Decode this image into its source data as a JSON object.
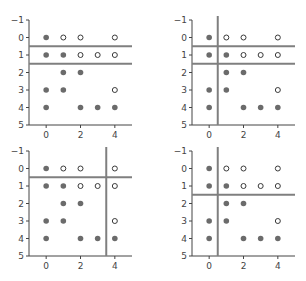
{
  "chart_data": [
    {
      "type": "scatter",
      "title": "",
      "xlabel": "",
      "ylabel": "",
      "xlim": [
        -1,
        5
      ],
      "ylim": [
        5,
        -1
      ],
      "xticks": [
        0,
        2,
        4
      ],
      "yticks": [
        -1,
        0,
        1,
        2,
        3,
        4,
        5
      ],
      "grid": false,
      "series": [
        {
          "name": "filled",
          "marker": "filled-circle",
          "points": [
            [
              0,
              0
            ],
            [
              0,
              1
            ],
            [
              1,
              1
            ],
            [
              1,
              2
            ],
            [
              2,
              2
            ],
            [
              0,
              3
            ],
            [
              1,
              3
            ],
            [
              0,
              4
            ],
            [
              2,
              4
            ],
            [
              3,
              4
            ],
            [
              4,
              4
            ]
          ]
        },
        {
          "name": "open",
          "marker": "open-circle",
          "points": [
            [
              1,
              0
            ],
            [
              2,
              0
            ],
            [
              4,
              0
            ],
            [
              2,
              1
            ],
            [
              3,
              1
            ],
            [
              4,
              1
            ],
            [
              4,
              3
            ]
          ]
        }
      ],
      "hlines": [
        0.5,
        1.5
      ],
      "vlines": []
    },
    {
      "type": "scatter",
      "title": "",
      "xlabel": "",
      "ylabel": "",
      "xlim": [
        -1,
        5
      ],
      "ylim": [
        5,
        -1
      ],
      "xticks": [
        0,
        2,
        4
      ],
      "yticks": [
        -1,
        0,
        1,
        2,
        3,
        4,
        5
      ],
      "grid": false,
      "series": [
        {
          "name": "filled",
          "marker": "filled-circle",
          "points": [
            [
              0,
              0
            ],
            [
              0,
              1
            ],
            [
              1,
              1
            ],
            [
              1,
              2
            ],
            [
              2,
              2
            ],
            [
              0,
              3
            ],
            [
              1,
              3
            ],
            [
              0,
              4
            ],
            [
              2,
              4
            ],
            [
              3,
              4
            ],
            [
              4,
              4
            ]
          ]
        },
        {
          "name": "open",
          "marker": "open-circle",
          "points": [
            [
              1,
              0
            ],
            [
              2,
              0
            ],
            [
              4,
              0
            ],
            [
              2,
              1
            ],
            [
              3,
              1
            ],
            [
              4,
              1
            ],
            [
              4,
              3
            ]
          ]
        }
      ],
      "hlines": [
        0.5,
        1.5
      ],
      "vlines": [
        0.5
      ]
    },
    {
      "type": "scatter",
      "title": "",
      "xlabel": "",
      "ylabel": "",
      "xlim": [
        -1,
        5
      ],
      "ylim": [
        5,
        -1
      ],
      "xticks": [
        0,
        2,
        4
      ],
      "yticks": [
        -1,
        0,
        1,
        2,
        3,
        4,
        5
      ],
      "grid": false,
      "series": [
        {
          "name": "filled",
          "marker": "filled-circle",
          "points": [
            [
              0,
              0
            ],
            [
              0,
              1
            ],
            [
              1,
              1
            ],
            [
              1,
              2
            ],
            [
              2,
              2
            ],
            [
              0,
              3
            ],
            [
              1,
              3
            ],
            [
              0,
              4
            ],
            [
              2,
              4
            ],
            [
              3,
              4
            ],
            [
              4,
              4
            ]
          ]
        },
        {
          "name": "open",
          "marker": "open-circle",
          "points": [
            [
              1,
              0
            ],
            [
              2,
              0
            ],
            [
              4,
              0
            ],
            [
              2,
              1
            ],
            [
              3,
              1
            ],
            [
              4,
              1
            ],
            [
              4,
              3
            ]
          ]
        }
      ],
      "hlines": [
        0.5
      ],
      "vlines": [
        3.5
      ]
    },
    {
      "type": "scatter",
      "title": "",
      "xlabel": "",
      "ylabel": "",
      "xlim": [
        -1,
        5
      ],
      "ylim": [
        5,
        -1
      ],
      "xticks": [
        0,
        2,
        4
      ],
      "yticks": [
        -1,
        0,
        1,
        2,
        3,
        4,
        5
      ],
      "grid": false,
      "series": [
        {
          "name": "filled",
          "marker": "filled-circle",
          "points": [
            [
              0,
              0
            ],
            [
              0,
              1
            ],
            [
              1,
              1
            ],
            [
              1,
              2
            ],
            [
              2,
              2
            ],
            [
              0,
              3
            ],
            [
              1,
              3
            ],
            [
              0,
              4
            ],
            [
              2,
              4
            ],
            [
              3,
              4
            ],
            [
              4,
              4
            ]
          ]
        },
        {
          "name": "open",
          "marker": "open-circle",
          "points": [
            [
              1,
              0
            ],
            [
              2,
              0
            ],
            [
              4,
              0
            ],
            [
              2,
              1
            ],
            [
              3,
              1
            ],
            [
              4,
              1
            ],
            [
              4,
              3
            ]
          ]
        }
      ],
      "hlines": [
        1.5
      ],
      "vlines": [
        0.5
      ]
    }
  ],
  "colors": {
    "filled_marker": "#6b6b6b",
    "open_marker_stroke": "#3a3a3a",
    "open_marker_fill": "#ffffff",
    "split_line": "#7f7f7f",
    "axis": "#444444"
  },
  "layout": {
    "panels": [
      {
        "x0": 29,
        "x1": 132,
        "y0": 20,
        "y1": 125
      },
      {
        "x0": 192,
        "x1": 295,
        "y0": 20,
        "y1": 125
      },
      {
        "x0": 29,
        "x1": 132,
        "y0": 151,
        "y1": 256
      },
      {
        "x0": 192,
        "x1": 295,
        "y0": 151,
        "y1": 256
      }
    ]
  }
}
